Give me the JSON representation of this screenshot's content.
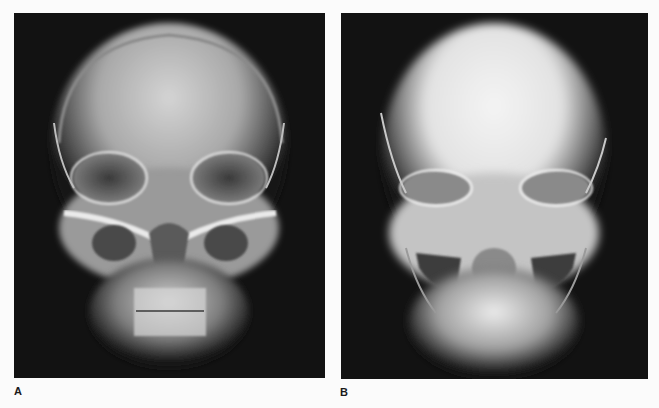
{
  "figure": {
    "panels": [
      {
        "label": "A",
        "description": "Frontal (PA) skull radiograph, normal exposure showing frontal bone, orbits, maxillary sinuses and teeth",
        "background_color": "#121212"
      },
      {
        "label": "B",
        "description": "Frontal (PA) skull radiograph with brighter overexposed cranial vault, orbits and maxilla",
        "background_color": "#121212"
      }
    ],
    "page_background": "#fbfbfb"
  }
}
